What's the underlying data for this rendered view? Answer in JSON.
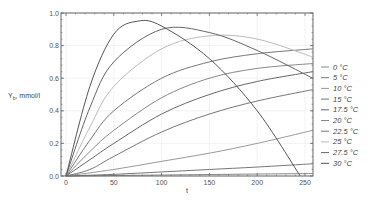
{
  "chart_data": {
    "type": "line",
    "title": "",
    "xlabel": "t",
    "ylabel": "Y_b, mmol/l",
    "xlim": [
      -3,
      258
    ],
    "ylim": [
      0,
      1.0
    ],
    "xticks": [
      0,
      50,
      100,
      150,
      200,
      250
    ],
    "yticks": [
      0.0,
      0.2,
      0.4,
      0.6,
      0.8,
      1.0
    ],
    "ytick_labels": [
      "0.0",
      "0.2",
      "0.4",
      "0.6",
      "0.8",
      "1.0"
    ],
    "grid": true,
    "legend_position": "right",
    "series": [
      {
        "name": "0 °C",
        "color": "#888888",
        "x": [
          0,
          50,
          100,
          150,
          200,
          258
        ],
        "values": [
          0,
          0.003,
          0.006,
          0.009,
          0.012,
          0.015
        ]
      },
      {
        "name": "5 °C",
        "color": "#777777",
        "x": [
          0,
          50,
          100,
          150,
          200,
          258
        ],
        "values": [
          0,
          0.01,
          0.025,
          0.04,
          0.055,
          0.075
        ]
      },
      {
        "name": "10 °C",
        "color": "#999999",
        "x": [
          0,
          50,
          100,
          150,
          200,
          258
        ],
        "values": [
          0,
          0.04,
          0.09,
          0.14,
          0.2,
          0.28
        ]
      },
      {
        "name": "15 °C",
        "color": "#777777",
        "x": [
          0,
          25,
          50,
          100,
          150,
          200,
          258
        ],
        "values": [
          0,
          0.04,
          0.12,
          0.27,
          0.38,
          0.46,
          0.53
        ]
      },
      {
        "name": "17.5 °C",
        "color": "#666666",
        "x": [
          0,
          25,
          50,
          100,
          150,
          200,
          258
        ],
        "values": [
          0,
          0.1,
          0.2,
          0.38,
          0.5,
          0.58,
          0.64
        ]
      },
      {
        "name": "20 °C",
        "color": "#888888",
        "x": [
          0,
          25,
          50,
          100,
          150,
          200,
          258
        ],
        "values": [
          0,
          0.15,
          0.28,
          0.48,
          0.6,
          0.66,
          0.69
        ]
      },
      {
        "name": "22.5 °C",
        "color": "#777777",
        "x": [
          0,
          25,
          50,
          100,
          150,
          200,
          258
        ],
        "values": [
          0,
          0.22,
          0.4,
          0.6,
          0.7,
          0.75,
          0.78
        ]
      },
      {
        "name": "25 °C",
        "color": "#bbbbbb",
        "x": [
          0,
          25,
          50,
          100,
          150,
          200,
          258
        ],
        "values": [
          0,
          0.3,
          0.55,
          0.78,
          0.86,
          0.84,
          0.73
        ]
      },
      {
        "name": "27.5 °C",
        "color": "#666666",
        "x": [
          0,
          25,
          50,
          100,
          150,
          200,
          258
        ],
        "values": [
          0,
          0.42,
          0.7,
          0.9,
          0.88,
          0.77,
          0.6
        ]
      },
      {
        "name": "30 °C",
        "color": "#555555",
        "x": [
          0,
          25,
          50,
          75,
          100,
          150,
          200,
          245
        ],
        "values": [
          0,
          0.55,
          0.87,
          0.95,
          0.92,
          0.72,
          0.4,
          0.0
        ]
      }
    ]
  },
  "legend": {
    "items": [
      "0 °C",
      "5 °C",
      "10 °C",
      "15 °C",
      "17.5 °C",
      "20 °C",
      "22.5 °C",
      "25 °C",
      "27.5 °C",
      "30 °C"
    ]
  }
}
